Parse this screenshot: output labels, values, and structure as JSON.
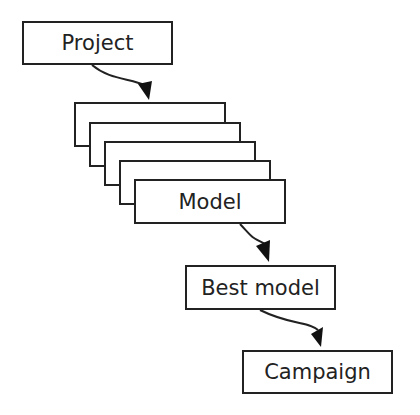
{
  "diagram": {
    "nodes": [
      {
        "id": "project",
        "label": "Project"
      },
      {
        "id": "model",
        "label": "Model",
        "stack_count": 5
      },
      {
        "id": "best_model",
        "label": "Best model"
      },
      {
        "id": "campaign",
        "label": "Campaign"
      }
    ],
    "edges": [
      {
        "from": "project",
        "to": "model"
      },
      {
        "from": "model",
        "to": "best_model"
      },
      {
        "from": "best_model",
        "to": "campaign"
      }
    ]
  }
}
